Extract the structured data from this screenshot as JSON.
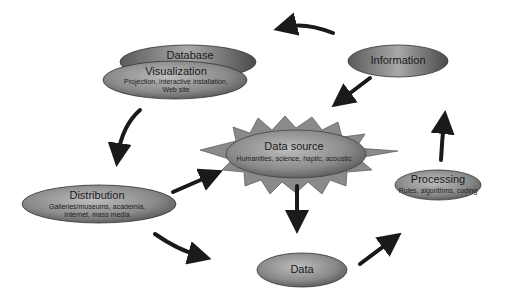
{
  "diagram": {
    "nodes": [
      {
        "id": "database",
        "title": "Database",
        "subtitle": ""
      },
      {
        "id": "visualization",
        "title": "Visualization",
        "subtitle_lines": [
          "Projection, interactive installation,",
          "Web site"
        ]
      },
      {
        "id": "information",
        "title": "Information",
        "subtitle": ""
      },
      {
        "id": "data_source",
        "title": "Data source",
        "subtitle": "Humanities, science, haptic, acoustic"
      },
      {
        "id": "distribution",
        "title": "Distribution",
        "subtitle_lines": [
          "Galleries/museums, academia,",
          "Internet, mass media"
        ]
      },
      {
        "id": "processing",
        "title": "Processing",
        "subtitle": "Rules, algorithms, coding"
      },
      {
        "id": "data",
        "title": "Data",
        "subtitle": ""
      }
    ],
    "edges": [
      {
        "from": "information",
        "to": "database",
        "style": "curved"
      },
      {
        "from": "information",
        "to": "data_source",
        "style": "straight"
      },
      {
        "from": "visualization",
        "to": "distribution",
        "style": "curved"
      },
      {
        "from": "distribution",
        "to": "data_source",
        "style": "straight"
      },
      {
        "from": "distribution",
        "to": "data",
        "style": "curved"
      },
      {
        "from": "data_source",
        "to": "data",
        "style": "straight"
      },
      {
        "from": "data",
        "to": "processing",
        "style": "straight"
      },
      {
        "from": "processing",
        "to": "information",
        "style": "straight"
      }
    ],
    "colors": {
      "ellipse_dark": "#4a4a4a",
      "ellipse_light": "#c8c8c8",
      "arrow": "#1a1a1a",
      "star": "#8a8a8a"
    }
  }
}
